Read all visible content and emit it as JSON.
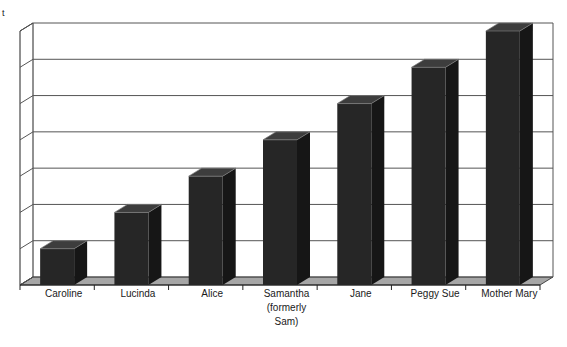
{
  "page": {
    "background": "#ffffff",
    "y_axis_title_fragment": "t"
  },
  "chart_data": {
    "type": "bar",
    "style": "3d-column",
    "title": "",
    "xlabel": "",
    "ylabel": "",
    "categories": [
      "Caroline",
      "Lucinda",
      "Alice",
      "Samantha (formerly Sam)",
      "Jane",
      "Peggy Sue",
      "Mother Mary"
    ],
    "category_label_lines": [
      [
        "Caroline"
      ],
      [
        "Lucinda"
      ],
      [
        "Alice"
      ],
      [
        "Samantha",
        "(formerly",
        "Sam)"
      ],
      [
        "Jane"
      ],
      [
        "Peggy Sue"
      ],
      [
        "Mother Mary"
      ]
    ],
    "values": [
      1,
      2,
      3,
      4,
      5,
      6,
      7
    ],
    "ylim": [
      0,
      7
    ],
    "gridline_interval": 1,
    "gridlines": true,
    "y_tick_labels_visible": false,
    "legend": "none",
    "colors": {
      "bar_front": "#262626",
      "bar_top": "#3d3d3d",
      "bar_side": "#161616",
      "bar_top_edge": "#7a7a7a",
      "floor": "#a6a6a6",
      "gridline": "#555555",
      "frame": "#222222",
      "label": "#1a1a1a",
      "background": "#ffffff"
    }
  }
}
